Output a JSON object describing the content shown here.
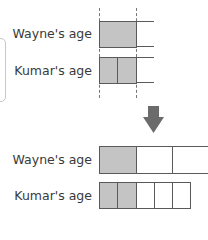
{
  "diagram": {
    "type": "bar-model",
    "top": {
      "rows": [
        {
          "label": "Wayne's age",
          "units": 1,
          "filled_units": 1,
          "unit_width": "1 whole",
          "open_ended": true
        },
        {
          "label": "Kumar's age",
          "units": 2,
          "filled_units": 2,
          "unit_width": "1/2 whole",
          "open_ended": true
        }
      ],
      "guides": "dashed vertical lines marking equal length"
    },
    "arrow": {
      "direction": "down",
      "icon": "down-arrow-icon"
    },
    "bottom": {
      "rows": [
        {
          "label": "Wayne's age",
          "units": 3,
          "filled_units": 1
        },
        {
          "label": "Kumar's age",
          "units": 5,
          "filled_units": 2
        }
      ]
    },
    "colors": {
      "filled": "#c4c4c4",
      "outline": "#5a5a5a",
      "arrow": "#6b6b6b",
      "text": "#3a3a3a"
    }
  }
}
